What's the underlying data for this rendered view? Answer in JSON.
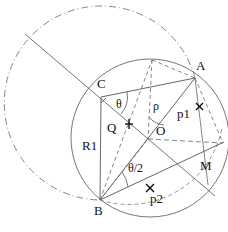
{
  "diagram": {
    "type": "geometric-construction",
    "colors": {
      "line": "#555555",
      "text": "#111111",
      "background": "#ffffff"
    },
    "points": {
      "C": {
        "label": "C",
        "x": 101,
        "y": 97
      },
      "A": {
        "label": "A",
        "x": 195,
        "y": 78
      },
      "B": {
        "label": "B",
        "x": 100,
        "y": 200
      },
      "O": {
        "label": "O",
        "x": 148,
        "y": 139
      },
      "M": {
        "label": "M",
        "x": 195,
        "y": 165
      },
      "Q": {
        "label": "Q",
        "x": 129,
        "y": 124
      },
      "p1": {
        "label": "p1",
        "x": 199,
        "y": 107
      },
      "p2": {
        "label": "p2",
        "x": 150,
        "y": 187
      }
    },
    "labels": {
      "C": "C",
      "A": "A",
      "B": "B",
      "O": "O",
      "M": "M",
      "Q": "Q",
      "p1": "p1",
      "p2": "p2",
      "R1": "R1",
      "theta": "θ",
      "rho": "ρ",
      "half_theta": "θ/2"
    },
    "markers": {
      "cross": "×"
    }
  }
}
